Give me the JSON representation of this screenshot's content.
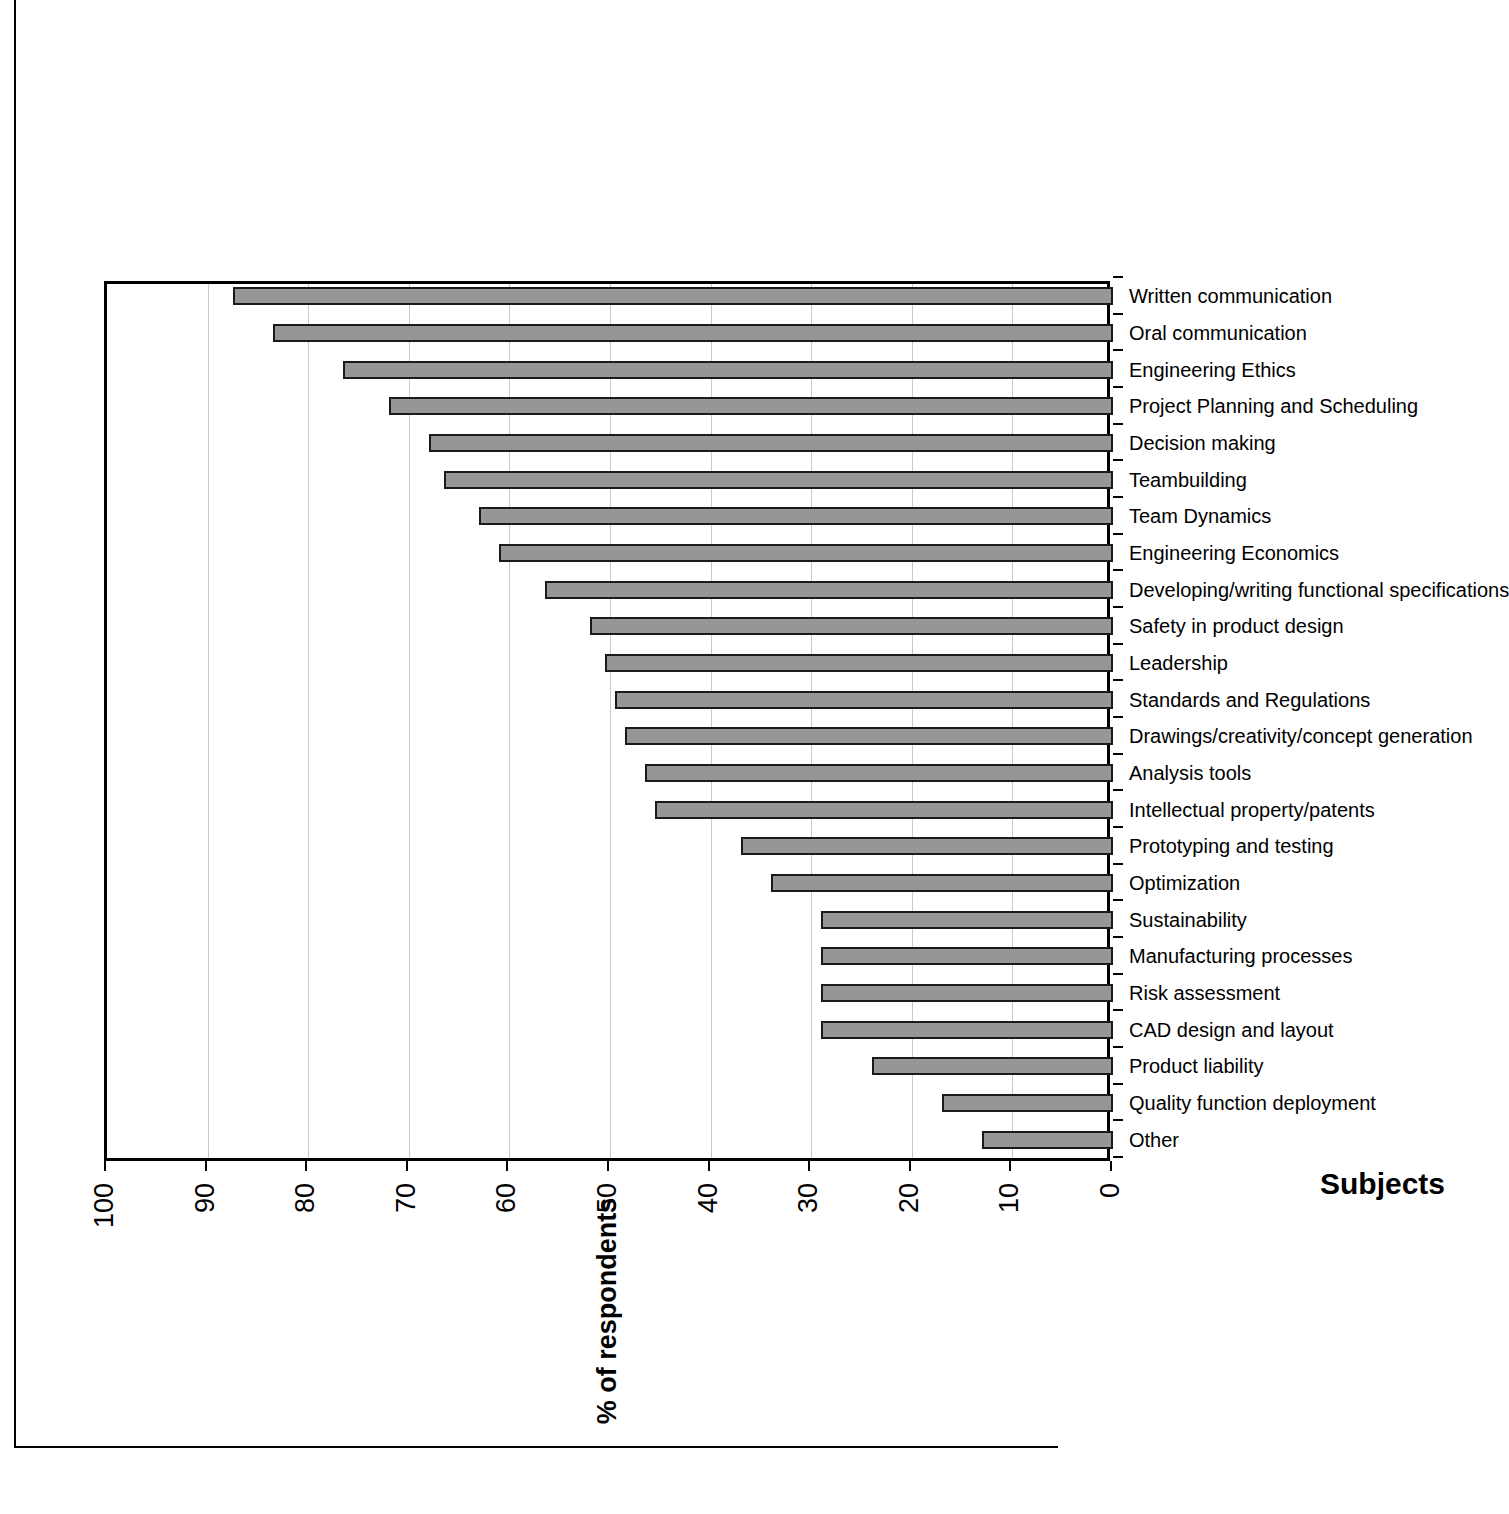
{
  "chart_data": {
    "type": "bar",
    "orientation": "vertical-printed-rotated",
    "title": "",
    "xlabel": "Subjects",
    "ylabel": "% of respondents",
    "ylim": [
      0,
      100
    ],
    "grid": true,
    "legend": false,
    "tick_labels": [
      "0",
      "10",
      "20",
      "30",
      "40",
      "50",
      "60",
      "70",
      "80",
      "90",
      "100"
    ],
    "ticks": [
      0,
      10,
      20,
      30,
      40,
      50,
      60,
      70,
      80,
      90,
      100
    ],
    "categories": [
      "Other",
      "Quality function deployment",
      "Product liability",
      "CAD design and layout",
      "Risk assessment",
      "Manufacturing processes",
      "Sustainability",
      "Optimization",
      "Prototyping and testing",
      "Intellectual property/patents",
      "Analysis tools",
      "Drawings/creativity/concept generation",
      "Standards and Regulations",
      "Leadership",
      "Safety in product design",
      "Developing/writing functional specifications",
      "Engineering Economics",
      "Team Dynamics",
      "Teambuilding",
      "Decision making",
      "Project Planning and Scheduling",
      "Engineering Ethics",
      "Oral communication",
      "Written communication"
    ],
    "values": [
      13,
      17,
      24,
      29,
      29,
      29,
      29,
      34,
      37,
      45.5,
      46.5,
      48.5,
      49.5,
      50.5,
      52,
      56.5,
      61,
      63,
      66.5,
      68,
      72,
      76.5,
      83.5,
      87.5
    ],
    "colors": {
      "bar_fill": "#969696",
      "bar_border": "#1a1a1a",
      "gridline": "#c9c9c9",
      "axis": "#000000",
      "background": "#ffffff"
    }
  }
}
